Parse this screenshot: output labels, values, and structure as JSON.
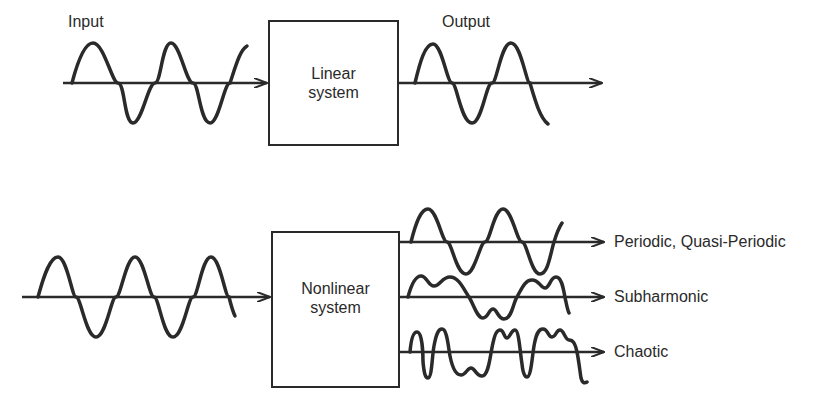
{
  "diagram": {
    "top": {
      "input_label": "Input",
      "output_label": "Output",
      "system": {
        "line1": "Linear",
        "line2": "system"
      }
    },
    "bottom": {
      "system": {
        "line1": "Nonlinear",
        "line2": "system"
      },
      "outputs": [
        {
          "label": "Periodic, Quasi-Periodic"
        },
        {
          "label": "Subharmonic"
        },
        {
          "label": "Chaotic"
        }
      ]
    },
    "colors": {
      "ink": "#2a2a2a",
      "background": "#ffffff"
    }
  }
}
